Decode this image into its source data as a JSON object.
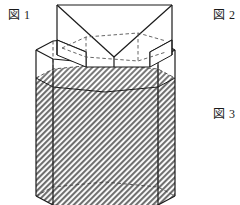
{
  "figure": {
    "labels": [
      {
        "id": "fig1",
        "text": "図 1",
        "x": 8,
        "y": 9
      },
      {
        "id": "fig2",
        "text": "図 2",
        "x": 213,
        "y": 9
      },
      {
        "id": "fig3",
        "text": "図 3",
        "x": 213,
        "y": 108
      }
    ],
    "colors": {
      "stroke": "#1a1a1a",
      "hidden_stroke": "#555555",
      "water_fill": "#9a9a9a",
      "background": "#ffffff",
      "face_fill": "#ffffff"
    },
    "geometry": {
      "prism": {
        "type": "hexagonal-prism",
        "left_x": 36,
        "right_x": 175,
        "top_rim_y": 50,
        "bottom_rim_y": 196,
        "top_back_y": 41,
        "top_front_y": 70,
        "shoulder_left_x": 53,
        "shoulder_right_x": 158
      },
      "water": {
        "label": "hatched water region",
        "surface_back_y": 78,
        "surface_front_y": 106,
        "surface_left_x": 36,
        "surface_right_x": 175
      },
      "box": {
        "type": "open-rectangular-box",
        "left_x": 57,
        "right_x": 172,
        "top_y": 5,
        "bottom_y": 67,
        "rim_back_y": 5,
        "rim_front_y": 40,
        "depth_y": 60
      }
    }
  }
}
